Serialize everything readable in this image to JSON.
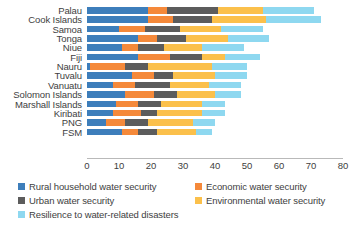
{
  "chart_data": {
    "type": "bar",
    "orientation": "horizontal",
    "stacked": true,
    "title": "",
    "xlabel": "",
    "ylabel": "",
    "xlim": [
      0,
      80
    ],
    "xticks": [
      0,
      10,
      20,
      30,
      40,
      50,
      60,
      70,
      80
    ],
    "grid": false,
    "legend_position": "bottom",
    "categories": [
      "Palau",
      "Cook Islands",
      "Samoa",
      "Tonga",
      "Niue",
      "Fiji",
      "Nauru",
      "Tuvalu",
      "Vanuatu",
      "Solomon Islands",
      "Marshall Islands",
      "Kiribati",
      "PNG",
      "FSM"
    ],
    "series": [
      {
        "name": "Rural household water security",
        "color": "#3d7ebb",
        "values": [
          19,
          19,
          10,
          16,
          11,
          16,
          1,
          14,
          8,
          12,
          9,
          8,
          6,
          11
        ]
      },
      {
        "name": "Economic water security",
        "color": "#f5893a",
        "values": [
          6,
          8,
          8,
          6,
          5,
          10,
          11,
          7,
          7,
          9,
          7,
          9,
          6,
          5
        ]
      },
      {
        "name": "Urban water security",
        "color": "#5c5c5c",
        "values": [
          16,
          12,
          11,
          9,
          8,
          10,
          7,
          6,
          11,
          7,
          7,
          5,
          7,
          6
        ]
      },
      {
        "name": "Environmental water security",
        "color": "#fbc04b",
        "values": [
          14,
          17,
          13,
          13,
          12,
          7,
          20,
          13,
          12,
          12,
          13,
          14,
          14,
          12
        ]
      },
      {
        "name": "Resilience to water-related disasters",
        "color": "#8ed8f0",
        "values": [
          16,
          17,
          13,
          13,
          13,
          11,
          11,
          10,
          10,
          8,
          7,
          7,
          7,
          5
        ]
      }
    ],
    "totals": [
      71,
      73,
      55,
      57,
      49,
      54,
      50,
      50,
      48,
      48,
      43,
      43,
      40,
      39
    ]
  },
  "axis": {
    "tick_labels": [
      "0",
      "10",
      "20",
      "30",
      "40",
      "50",
      "60",
      "70",
      "80"
    ]
  },
  "legend": {
    "items": [
      {
        "label": "Rural household water security",
        "swatch": "legend-swatch-rural"
      },
      {
        "label": "Urban water security",
        "swatch": "legend-swatch-urban"
      },
      {
        "label": "Resilience to water-related disasters",
        "swatch": "legend-swatch-resilience"
      },
      {
        "label": "Economic water security",
        "swatch": "legend-swatch-economic"
      },
      {
        "label": "Environmental water security",
        "swatch": "legend-swatch-environmental"
      }
    ]
  }
}
